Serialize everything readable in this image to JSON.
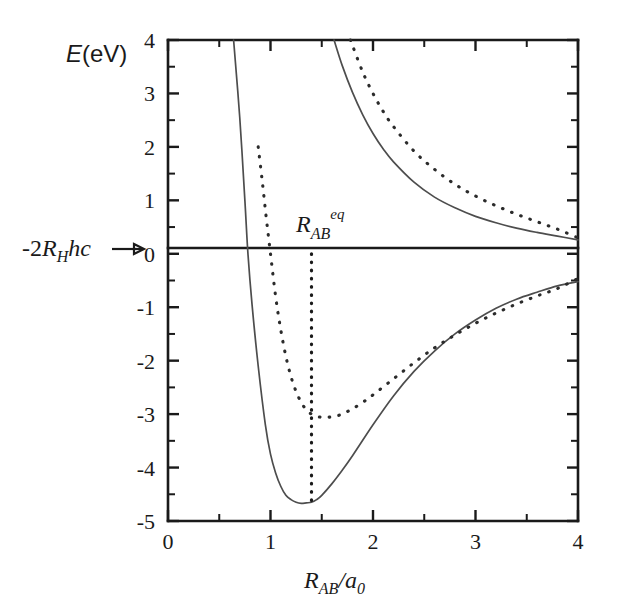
{
  "figure": {
    "name": "potential-energy-curves-h2-molecular-orbital",
    "background_color": "#ffffff",
    "ink_color": "#1a1a1a"
  },
  "axes": {
    "x": {
      "label_parts": {
        "main": "R",
        "sub": "AB",
        "divider": "/",
        "denom": "a",
        "denom_sub": "0"
      },
      "label_text": "R_AB/a_0",
      "min": 0,
      "max": 4,
      "major_ticks": [
        0,
        1,
        2,
        3,
        4
      ],
      "major_tick_labels": [
        "0",
        "1",
        "2",
        "3",
        "4"
      ],
      "minor_ticks": [
        0.5,
        1.5,
        2.5,
        3.5
      ]
    },
    "y": {
      "label_parts": {
        "italic": "E",
        "rest": "(eV)"
      },
      "label_text": "E(eV)",
      "min": -5,
      "max": 4,
      "major_ticks": [
        -5,
        -4,
        -3,
        -2,
        -1,
        0,
        1,
        2,
        3,
        4
      ],
      "major_tick_labels": [
        "-5",
        "-4",
        "-3",
        "-2",
        "-1",
        "0",
        "1",
        "2",
        "3",
        "4"
      ],
      "minor_ticks": [
        -4.5,
        -3.5,
        -2.5,
        -1.5,
        -0.5,
        0.5,
        1.5,
        2.5,
        3.5
      ]
    }
  },
  "annotations": {
    "zero_reference": {
      "text": "-2R_Hhc",
      "parts": {
        "prefix": "-2",
        "italic_r": "R",
        "sub": "H",
        "italic_hc": "hc"
      },
      "arrow_glyph": "→",
      "points_to_y": 0
    },
    "equilibrium": {
      "text": "R_AB^eq",
      "parts": {
        "italic_r": "R",
        "sub": "AB",
        "sup": "eq"
      },
      "x_value": 1.4,
      "guide_line_style": "dotted-vertical",
      "guide_from_y": 0,
      "guide_to_y": -4.65
    }
  },
  "chart_data": {
    "type": "line",
    "title": "",
    "xlabel": "R_AB/a_0",
    "ylabel": "E(eV)",
    "xlim": [
      0,
      4
    ],
    "ylim": [
      -5,
      4
    ],
    "grid": false,
    "legend": null,
    "series": [
      {
        "name": "bonding-exact-solid",
        "style": "solid",
        "description": "Bonding (sigma_g) potential energy curve, solid line, deep well",
        "x": [
          0.64,
          0.7,
          0.75,
          0.78,
          0.82,
          0.88,
          0.95,
          1.0,
          1.05,
          1.1,
          1.15,
          1.2,
          1.25,
          1.3,
          1.35,
          1.4,
          1.45,
          1.5,
          1.6,
          1.7,
          1.8,
          2.0,
          2.2,
          2.4,
          2.6,
          2.8,
          3.0,
          3.2,
          3.4,
          3.6,
          3.8,
          4.0
        ],
        "y": [
          4.0,
          2.55,
          1.0,
          0.0,
          -0.95,
          -2.1,
          -3.2,
          -3.75,
          -4.1,
          -4.35,
          -4.52,
          -4.6,
          -4.65,
          -4.67,
          -4.66,
          -4.65,
          -4.6,
          -4.52,
          -4.3,
          -4.05,
          -3.78,
          -3.2,
          -2.66,
          -2.2,
          -1.82,
          -1.5,
          -1.24,
          -1.02,
          -0.85,
          -0.72,
          -0.6,
          -0.52
        ]
      },
      {
        "name": "bonding-approx-dashed",
        "style": "dashed",
        "description": "Bonding LCAO approximate curve, dashed, shallower well",
        "x": [
          0.88,
          0.92,
          0.96,
          1.0,
          1.05,
          1.1,
          1.15,
          1.2,
          1.25,
          1.3,
          1.35,
          1.4,
          1.45,
          1.5,
          1.55,
          1.6,
          1.65,
          1.7,
          1.8,
          1.9,
          2.0,
          2.2,
          2.4,
          2.6,
          2.8,
          3.0,
          3.2,
          3.4,
          3.6,
          3.8,
          4.0
        ],
        "y": [
          2.0,
          1.35,
          0.65,
          0.0,
          -0.8,
          -1.42,
          -1.92,
          -2.3,
          -2.58,
          -2.78,
          -2.92,
          -3.0,
          -3.04,
          -3.06,
          -3.06,
          -3.05,
          -3.03,
          -3.0,
          -2.9,
          -2.78,
          -2.64,
          -2.34,
          -2.04,
          -1.76,
          -1.52,
          -1.3,
          -1.11,
          -0.94,
          -0.79,
          -0.65,
          -0.46
        ]
      },
      {
        "name": "antibonding-exact-solid",
        "style": "solid",
        "description": "Antibonding (sigma_u) curve, solid, purely repulsive",
        "x": [
          1.62,
          1.7,
          1.8,
          1.9,
          2.0,
          2.1,
          2.2,
          2.4,
          2.6,
          2.8,
          3.0,
          3.2,
          3.4,
          3.6,
          3.8,
          4.0
        ],
        "y": [
          4.0,
          3.52,
          3.02,
          2.6,
          2.25,
          1.96,
          1.72,
          1.34,
          1.06,
          0.86,
          0.7,
          0.58,
          0.48,
          0.4,
          0.33,
          0.26
        ]
      },
      {
        "name": "antibonding-approx-dashed",
        "style": "dashed",
        "description": "Antibonding LCAO approximate curve, dashed, purely repulsive, above solid",
        "x": [
          1.78,
          1.9,
          2.0,
          2.1,
          2.2,
          2.4,
          2.6,
          2.8,
          3.0,
          3.2,
          3.4,
          3.6,
          3.8,
          4.0
        ],
        "y": [
          4.0,
          3.4,
          3.0,
          2.66,
          2.38,
          1.92,
          1.58,
          1.3,
          1.08,
          0.9,
          0.74,
          0.6,
          0.46,
          0.3
        ]
      }
    ],
    "key_points": {
      "solid_minimum": {
        "x": 1.4,
        "y": -4.65
      },
      "dashed_minimum": {
        "x": 1.6,
        "y": -3.05
      },
      "solid_zero_crossing": {
        "x": 0.78,
        "y": 0
      },
      "dashed_zero_crossing": {
        "x": 1.0,
        "y": 0
      }
    }
  }
}
